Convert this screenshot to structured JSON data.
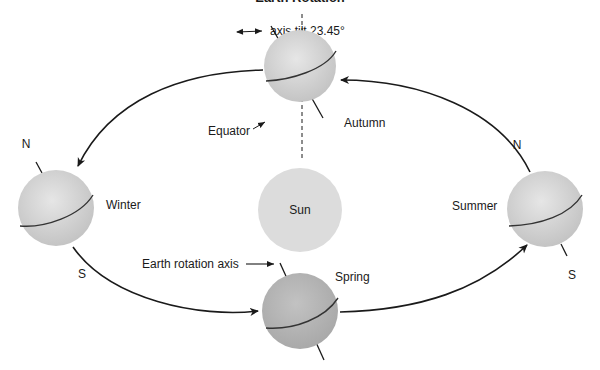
{
  "title": "Earth Rotation",
  "labels": {
    "axis_tilt": "axis tilt 23.45°",
    "equator": "Equator",
    "earth_rotation_axis": "Earth rotation axis",
    "sun": "Sun",
    "north": "N",
    "south": "S"
  },
  "seasons": {
    "autumn": "Autumn",
    "winter": "Winter",
    "summer": "Summer",
    "spring": "Spring"
  },
  "colors": {
    "globe_light": "#d4d4d4",
    "globe_spring": "#b8b8b8",
    "sun": "#dcdcdc",
    "line": "#1a1a1a"
  }
}
